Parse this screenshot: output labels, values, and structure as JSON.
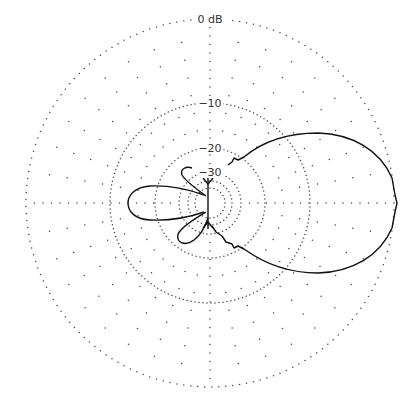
{
  "chart_data": {
    "type": "polar",
    "title": "",
    "units": "dB",
    "radial_range": [
      -40,
      0
    ],
    "ring_labels": [
      {
        "level": 0,
        "text": "0 dB",
        "r": 184
      },
      {
        "level": -10,
        "text": "−10",
        "r": 100
      },
      {
        "level": -20,
        "text": "−20",
        "r": 55
      },
      {
        "level": -30,
        "text": "−30",
        "r": 31
      }
    ],
    "grid": {
      "rings_dense": [
        184,
        100,
        55,
        31,
        22,
        15
      ],
      "spoke_step_deg": 10,
      "spoke_dot_spacing": 18,
      "on": true
    },
    "series": [
      {
        "name": "radiation pattern",
        "description": "Directional pattern with main lobe at 0° (right) reaching 0 dB, back lobe at 180° around −13 dB, and two small side lobes near −30 dB",
        "main_lobe": {
          "direction_deg": 0,
          "peak_db": 0,
          "beamwidth_deg_approx": 60
        },
        "back_lobe": {
          "direction_deg": 180,
          "peak_db_approx": -13
        },
        "side_lobes": [
          {
            "direction_deg_approx": 105,
            "peak_db_approx": -28
          },
          {
            "direction_deg_approx": 250,
            "peak_db_approx": -25
          }
        ]
      }
    ],
    "legend": null
  },
  "geometry": {
    "center": [
      210,
      203
    ],
    "outer_radius": 184
  }
}
